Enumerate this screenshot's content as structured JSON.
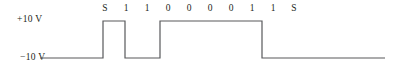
{
  "figure": {
    "name": "binary-serial-waveform",
    "voltage_labels": {
      "high": "+10 V",
      "low": "−10 V"
    },
    "bit_sequence": [
      "S",
      "1",
      "1",
      "0",
      "0",
      "0",
      "0",
      "1",
      "1",
      "S"
    ],
    "line_color": "#58595b",
    "text_color": "#231f20",
    "background": "#ffffff"
  },
  "chart_data": {
    "type": "line",
    "title": "",
    "xlabel": "",
    "ylabel": "",
    "ylim": [
      -10,
      10
    ],
    "ytick_labels": [
      "+10 V",
      "−10 V"
    ],
    "yticks": [
      10,
      -10
    ],
    "grid": false,
    "legend": null,
    "annotations": [
      "S",
      "1",
      "1",
      "0",
      "0",
      "0",
      "0",
      "1",
      "1",
      "S"
    ],
    "series": [
      {
        "name": "signal",
        "x": [
          40,
          103,
          103,
          125,
          125,
          160,
          160,
          262,
          262,
          385
        ],
        "values": [
          -10,
          -10,
          10,
          10,
          -10,
          -10,
          10,
          10,
          -10,
          -10
        ]
      }
    ]
  },
  "geometry": {
    "y_high_px": 21,
    "y_low_px": 58,
    "x_start_px": 40,
    "x_end_px": 385,
    "bit_x_px": [
      105,
      126,
      147,
      168,
      189,
      210,
      231,
      252,
      273,
      294
    ],
    "transitions_px": [
      103,
      125,
      160,
      262
    ]
  }
}
